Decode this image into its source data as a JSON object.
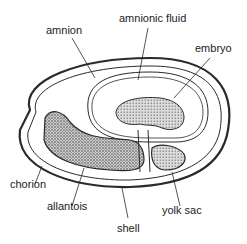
{
  "labels": {
    "amnion": "amnion",
    "amnionic_fluid": "amnionic fluid",
    "embryo": "embryo",
    "chorion": "chorion",
    "allantois": "allantois",
    "shell": "shell",
    "yolk_sac": "yolk sac"
  },
  "colors": {
    "line": "#2a2a2a",
    "stipple": "#555555",
    "background": "#ffffff"
  }
}
